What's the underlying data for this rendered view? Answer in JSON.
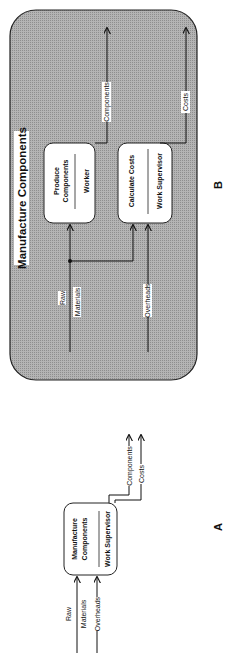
{
  "diagram_b": {
    "label": "B",
    "title": "Manufacture Components",
    "fill_color": "#a6a6a6",
    "activities": [
      {
        "name_line1": "Produce",
        "name_line2": "Components",
        "mechanism": "Worker"
      },
      {
        "name_line1": "Calculate Costs",
        "name_line2": "",
        "mechanism": "Work Supervisor"
      }
    ],
    "inputs": [
      {
        "line1": "Raw",
        "line2": "Materials"
      },
      {
        "line1": "Overheads"
      }
    ],
    "outputs": [
      {
        "label": "Components"
      },
      {
        "label": "Costs"
      }
    ]
  },
  "diagram_a": {
    "label": "A",
    "activity": {
      "name_line1": "Manufacture",
      "name_line2": "Components",
      "mechanism": "Work Supervisor"
    },
    "inputs": [
      {
        "line1": "Raw",
        "line2": "Materials"
      },
      {
        "line1": "Overheads"
      }
    ],
    "outputs": [
      {
        "label": "Components"
      },
      {
        "label": "Costs"
      }
    ]
  }
}
